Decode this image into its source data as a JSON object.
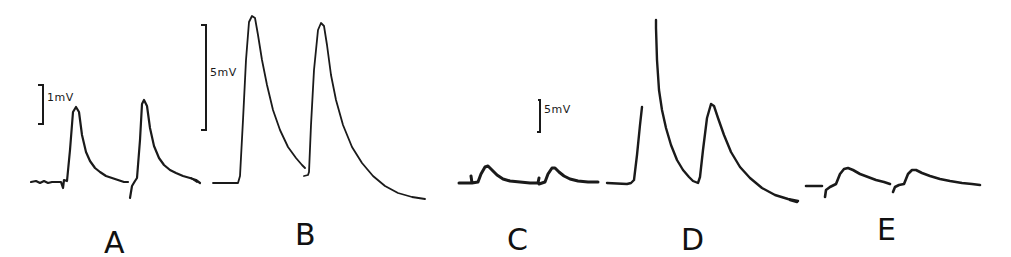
{
  "figure": {
    "panels": [
      {
        "label": "A",
        "scale_bar": "1mV"
      },
      {
        "label": "B",
        "scale_bar": "5mV"
      },
      {
        "label": "C",
        "scale_bar": "5mV"
      },
      {
        "label": "D",
        "scale_bar": ""
      },
      {
        "label": "E",
        "scale_bar": ""
      }
    ],
    "colors": {
      "ink": "#1a1a1a",
      "background": "#ffffff"
    }
  }
}
